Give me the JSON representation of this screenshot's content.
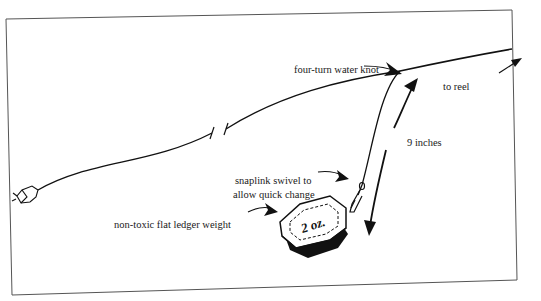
{
  "diagram": {
    "labels": {
      "knot": "four-turn water knot",
      "reel": "to reel",
      "length": "9 inches",
      "swivel_line1": "snaplink swivel to",
      "swivel_line2": "allow quick change",
      "weight": "non-toxic flat ledger weight",
      "weight_marking": "2 oz."
    },
    "colors": {
      "ink": "#111111",
      "frame": "#555555",
      "background": "#ffffff"
    }
  }
}
